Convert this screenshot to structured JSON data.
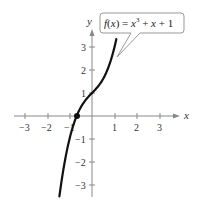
{
  "chart_data": {
    "type": "line",
    "title": "",
    "function_label": "f(x) = x³ + x + 1",
    "xlabel": "x",
    "ylabel": "y",
    "xlim": [
      -3.5,
      3.5
    ],
    "ylim": [
      -3.5,
      3.5
    ],
    "x_ticks": [
      -3,
      -2,
      -1,
      1,
      2,
      3
    ],
    "y_ticks": [
      -3,
      -2,
      -1,
      1,
      2,
      3
    ],
    "x_tick_labels": [
      "−3",
      "−2",
      "−1",
      "1",
      "2",
      "3"
    ],
    "y_tick_labels": [
      "−3",
      "−2",
      "−1",
      "1",
      "2",
      "3"
    ],
    "grid": false,
    "series": [
      {
        "name": "f(x) = x^3 + x + 1",
        "x_range": [
          -1.45,
          1.08
        ],
        "points": [
          [
            -1.45,
            -3.5
          ],
          [
            -1.2,
            -1.93
          ],
          [
            -1.0,
            -1.0
          ],
          [
            -0.8,
            -0.31
          ],
          [
            -0.68,
            0.0
          ],
          [
            -0.5,
            0.375
          ],
          [
            0,
            1
          ],
          [
            0.5,
            1.625
          ],
          [
            0.8,
            2.31
          ],
          [
            1.0,
            3.0
          ],
          [
            1.08,
            3.34
          ]
        ]
      }
    ],
    "marked_points": [
      {
        "x": -0.68,
        "y": 0,
        "label": "real zero"
      }
    ]
  },
  "callout": {
    "prefix": "f(x) = x",
    "exponent": "3",
    "suffix": " + x + 1"
  }
}
